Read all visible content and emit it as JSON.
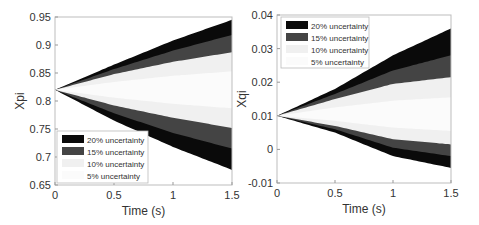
{
  "chart_data": [
    {
      "type": "area",
      "title": "",
      "xlabel": "Time (s)",
      "ylabel": "Xpi",
      "xlim": [
        0,
        1.5
      ],
      "ylim": [
        0.65,
        0.95
      ],
      "xticks": [
        "0",
        "0.5",
        "1",
        "1.5"
      ],
      "yticks": [
        "0.65",
        "0.7",
        "0.75",
        "0.8",
        "0.85",
        "0.9",
        "0.95"
      ],
      "grid": false,
      "legend_position": "lower left",
      "x": [
        0,
        0.5,
        1.0,
        1.5
      ],
      "series": [
        {
          "name": "20% uncertainty",
          "upper": [
            0.82,
            0.865,
            0.908,
            0.945
          ],
          "lower": [
            0.82,
            0.765,
            0.718,
            0.677
          ]
        },
        {
          "name": "15% uncertainty",
          "upper": [
            0.82,
            0.857,
            0.89,
            0.918
          ],
          "lower": [
            0.82,
            0.778,
            0.743,
            0.715
          ]
        },
        {
          "name": "10% uncertainty",
          "upper": [
            0.82,
            0.848,
            0.87,
            0.887
          ],
          "lower": [
            0.82,
            0.792,
            0.77,
            0.752
          ]
        },
        {
          "name": "5% uncertainty",
          "upper": [
            0.82,
            0.834,
            0.845,
            0.853
          ],
          "lower": [
            0.82,
            0.806,
            0.795,
            0.787
          ]
        }
      ]
    },
    {
      "type": "area",
      "title": "",
      "xlabel": "Time (s)",
      "ylabel": "Xqi",
      "xlim": [
        0,
        1.5
      ],
      "ylim": [
        -0.01,
        0.04
      ],
      "xticks": [
        "0",
        "0.5",
        "1",
        "1.5"
      ],
      "yticks": [
        "-0.01",
        "0",
        "0.01",
        "0.02",
        "0.03",
        "0.04"
      ],
      "grid": false,
      "legend_position": "upper left",
      "x": [
        0,
        0.5,
        1.0,
        1.5
      ],
      "series": [
        {
          "name": "20% uncertainty",
          "upper": [
            0.01,
            0.018,
            0.028,
            0.036
          ],
          "lower": [
            0.01,
            0.005,
            -0.002,
            -0.0055
          ]
        },
        {
          "name": "15% uncertainty",
          "upper": [
            0.01,
            0.0165,
            0.0235,
            0.028
          ],
          "lower": [
            0.01,
            0.006,
            0.0005,
            -0.002
          ]
        },
        {
          "name": "10% uncertainty",
          "upper": [
            0.01,
            0.015,
            0.0195,
            0.0215
          ],
          "lower": [
            0.01,
            0.007,
            0.003,
            0.0015
          ]
        },
        {
          "name": "5% uncertainty",
          "upper": [
            0.01,
            0.0125,
            0.0145,
            0.0155
          ],
          "lower": [
            0.01,
            0.0085,
            0.0065,
            0.0055
          ]
        }
      ]
    }
  ],
  "legend": {
    "items": [
      "20% uncertainty",
      "15% uncertainty",
      "10% uncertainty",
      "5% uncertainty"
    ],
    "colors": [
      "#0a0a0a",
      "#444444",
      "#f0f0f0",
      "#fbfbfb"
    ]
  },
  "left": {
    "ylabel": "Xpi",
    "xlabel": "Time (s)"
  },
  "right": {
    "ylabel": "Xqi",
    "xlabel": "Time (s)"
  }
}
